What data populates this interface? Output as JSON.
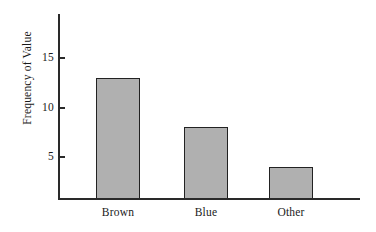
{
  "chart_data": {
    "type": "bar",
    "title": "",
    "xlabel": "",
    "ylabel": "Frequency of Value",
    "categories": [
      "Brown",
      "Blue",
      "Other"
    ],
    "values": [
      13,
      8,
      4
    ],
    "ylim": [
      0,
      17
    ],
    "yticks": [
      5,
      10,
      15
    ],
    "ytick_labels": [
      "5",
      "10",
      "15"
    ],
    "grid": false,
    "legend": false,
    "bar_fill_color": "#b0b0b0",
    "bar_edge_color": "#222222",
    "axis_color": "#2a2a2a",
    "background_color": "#ffffff"
  },
  "axis": {
    "y_label": "Frequency of Value",
    "ticks": [
      {
        "label": "15",
        "value": 15
      },
      {
        "label": "10",
        "value": 10
      },
      {
        "label": "5",
        "value": 5
      }
    ]
  },
  "bars": [
    {
      "label": "Brown",
      "value": 13
    },
    {
      "label": "Blue",
      "value": 8
    },
    {
      "label": "Other",
      "value": 4
    }
  ]
}
